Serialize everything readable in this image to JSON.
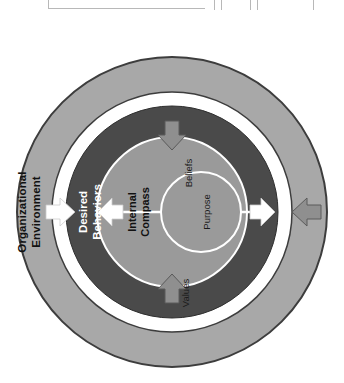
{
  "document": {
    "title": "Internal Compass concentric model",
    "background_color": "#ffffff",
    "table_remnant_visible": true
  },
  "palette": {
    "outer_ring_fill": "#a8a8a8",
    "outer_ring_stroke": "#3d3d3d",
    "white_ring_fill": "#ffffff",
    "dark_ring_fill": "#4a4a4a",
    "dark_ring_stroke": "#2e2e2e",
    "mid_circle_fill": "#9a9a9a",
    "mid_circle_stroke": "#ffffff",
    "inner_circle_fill": "#9a9a9a",
    "inner_circle_stroke": "#ffffff",
    "inward_arrow_fill": "#8f8f8f",
    "inward_arrow_stroke": "#5a5a5a",
    "white_arrow_fill": "#ffffff",
    "label_dark": "#111111",
    "label_light": "#ffffff",
    "table_line": "#b8b8b8"
  },
  "diagram": {
    "orientation_note": "rotated 90 degrees; labels read bottom-to-top",
    "rings": [
      {
        "id": "organizational-environment",
        "label": "Organizational Environment",
        "label_lines": [
          "Organizational",
          "Environment"
        ],
        "level": 1,
        "text_color": "#111111"
      },
      {
        "id": "white-separator",
        "label": "",
        "level": 2,
        "text_color": "#ffffff"
      },
      {
        "id": "desired-behaviors",
        "label": "Desired Behaviors",
        "label_lines": [
          "Desired",
          "Behaviors"
        ],
        "level": 3,
        "text_color": "#ffffff"
      },
      {
        "id": "internal-compass",
        "label": "Internal Compass",
        "label_lines": [
          "Internal",
          "Compass"
        ],
        "level": 4,
        "text_color": "#111111"
      },
      {
        "id": "purpose",
        "label": "Purpose",
        "label_lines": [
          "Purpose"
        ],
        "level": 5,
        "text_color": "#111111"
      }
    ],
    "compass_segments": [
      {
        "id": "beliefs",
        "label": "Beliefs"
      },
      {
        "id": "values",
        "label": "Values"
      }
    ],
    "inward_arrows": [
      {
        "id": "arrow-top",
        "direction": "down",
        "style": "gray"
      },
      {
        "id": "arrow-right",
        "direction": "left",
        "style": "gray"
      },
      {
        "id": "arrow-bottom",
        "direction": "up",
        "style": "gray"
      },
      {
        "id": "arrow-left",
        "direction": "right",
        "style": "white"
      }
    ],
    "center_arrows": [
      {
        "id": "center-arrow-left",
        "direction": "left",
        "style": "white"
      },
      {
        "id": "center-arrow-right",
        "direction": "right",
        "style": "white"
      }
    ]
  }
}
